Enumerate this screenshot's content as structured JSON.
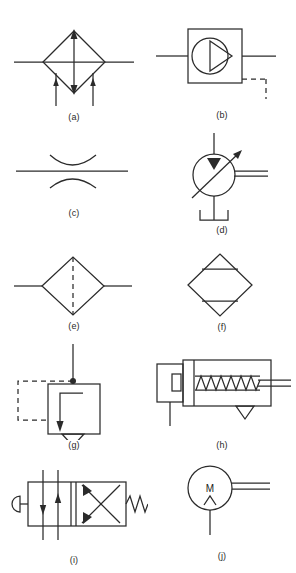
{
  "figure": {
    "background_color": "#ffffff",
    "line_color": "#2b2b2b",
    "width": 296,
    "height": 573
  },
  "symbols": [
    {
      "id": "a",
      "caption": "(a)",
      "name": "air-dryer-diamond-symbol",
      "description": "Diamond conditioning unit with through line, vertical double arrow and two inlet arrows",
      "cell": {
        "x": 0,
        "y": 0,
        "width": 148,
        "height": 130
      }
    },
    {
      "id": "b",
      "caption": "(b)",
      "name": "pump-in-enclosure-symbol",
      "description": "Square enclosure containing circle with single delivery arrow and dashed drain line",
      "cell": {
        "x": 148,
        "y": 0,
        "width": 148,
        "height": 130
      }
    },
    {
      "id": "c",
      "caption": "(c)",
      "name": "restrictor-orifice-symbol",
      "description": "Fixed restriction: flow line between two opposed arcs",
      "cell": {
        "x": 0,
        "y": 130,
        "width": 148,
        "height": 115
      }
    },
    {
      "id": "d",
      "caption": "(d)",
      "name": "variable-pump-motor-symbol",
      "description": "Circle with filled triangle port, variable arrow across it, double delivery line and drain",
      "cell": {
        "x": 148,
        "y": 130,
        "width": 148,
        "height": 115
      }
    },
    {
      "id": "e",
      "caption": "(e)",
      "name": "filter-symbol",
      "description": "Diamond with vertical dashed element line",
      "cell": {
        "x": 0,
        "y": 245,
        "width": 148,
        "height": 95
      }
    },
    {
      "id": "f",
      "caption": "(f)",
      "name": "heat-exchanger-symbol",
      "description": "Diamond with two horizontal solid bars",
      "cell": {
        "x": 148,
        "y": 245,
        "width": 148,
        "height": 95
      }
    },
    {
      "id": "g",
      "caption": "(g)",
      "name": "pilot-operated-relief-valve-symbol",
      "description": "Square valve envelope with internal arrow, pilot dashed line and drain triangle",
      "cell": {
        "x": 0,
        "y": 340,
        "width": 148,
        "height": 115
      }
    },
    {
      "id": "h",
      "caption": "(h)",
      "name": "spring-return-cylinder-symbol",
      "description": "Single acting cylinder with spring return and rod out to the right",
      "cell": {
        "x": 148,
        "y": 340,
        "width": 148,
        "height": 115
      }
    },
    {
      "id": "i",
      "caption": "(i)",
      "name": "two-position-push-button-valve-symbol",
      "description": "Two position directional valve, push button actuator, spring return, crossed flow paths",
      "cell": {
        "x": 0,
        "y": 455,
        "width": 148,
        "height": 118
      }
    },
    {
      "id": "j",
      "caption": "(j)",
      "name": "electric-motor-symbol",
      "description": "Circle labelled M with drive shaft double line",
      "cell": {
        "x": 148,
        "y": 455,
        "width": 148,
        "height": 118
      },
      "glyph": "M"
    }
  ]
}
